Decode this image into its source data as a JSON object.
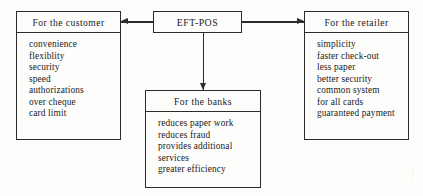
{
  "diagram": {
    "type": "flow-diagram",
    "colors": {
      "stroke": "#2b2b2b",
      "background": "#fdfdfc",
      "text": "#1a1a1a"
    },
    "center": {
      "label": "EFT-POS"
    },
    "nodes": [
      {
        "id": "customer",
        "header": "For the customer",
        "items": [
          "convenience",
          "flexiblity",
          "security",
          "speed",
          "authorizations",
          "over cheque",
          "card limit"
        ]
      },
      {
        "id": "banks",
        "header": "For the banks",
        "items": [
          "reduces paper work",
          "reduces fraud",
          "provides additional",
          "services",
          "greater efficiency"
        ]
      },
      {
        "id": "retailer",
        "header": "For the retailer",
        "items": [
          "simplicity",
          "faster check-out",
          "less paper",
          "better security",
          "common system",
          "for all cards",
          "guaranteed payment"
        ]
      }
    ],
    "connectors": [
      {
        "id": "eftpos-to-customer",
        "from": "EFT-POS",
        "to": "For the customer",
        "direction": "left"
      },
      {
        "id": "eftpos-to-retailer",
        "from": "EFT-POS",
        "to": "For the retailer",
        "direction": "right"
      },
      {
        "id": "eftpos-to-banks",
        "from": "EFT-POS",
        "to": "For the banks",
        "direction": "down"
      }
    ],
    "artifact": "|"
  }
}
